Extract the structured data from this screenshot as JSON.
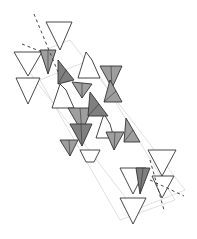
{
  "diagram": {
    "type": "crystal-structure-polyhedra",
    "colors": {
      "background": "#ffffff",
      "stroke": "#333333",
      "shaded": "#9e9e9e",
      "shaded_dark": "#7f7f7f",
      "open": "#ffffff",
      "ghost": "#d8d8d8",
      "axis": "#444444"
    },
    "ghost_bands": [
      [
        [
          20,
          60
        ],
        [
          70,
          40
        ],
        [
          185,
          190
        ],
        [
          135,
          210
        ]
      ],
      [
        [
          40,
          80
        ],
        [
          90,
          60
        ],
        [
          175,
          200
        ],
        [
          120,
          220
        ]
      ]
    ],
    "open_triangles": [
      [
        [
          46,
          22
        ],
        [
          72,
          22
        ],
        [
          60,
          50
        ]
      ],
      [
        [
          14,
          52
        ],
        [
          42,
          52
        ],
        [
          28,
          76
        ]
      ],
      [
        [
          16,
          78
        ],
        [
          40,
          78
        ],
        [
          28,
          104
        ]
      ],
      [
        [
          86,
          52
        ],
        [
          92,
          60
        ],
        [
          100,
          78
        ],
        [
          78,
          78
        ]
      ],
      [
        [
          60,
          84
        ],
        [
          66,
          90
        ],
        [
          74,
          108
        ],
        [
          52,
          108
        ]
      ],
      [
        [
          104,
          114
        ],
        [
          110,
          124
        ],
        [
          114,
          138
        ],
        [
          96,
          138
        ]
      ],
      [
        [
          120,
          168
        ],
        [
          146,
          168
        ],
        [
          133,
          194
        ]
      ],
      [
        [
          120,
          198
        ],
        [
          146,
          198
        ],
        [
          133,
          224
        ]
      ],
      [
        [
          148,
          150
        ],
        [
          176,
          150
        ],
        [
          162,
          176
        ]
      ],
      [
        [
          152,
          176
        ],
        [
          174,
          176
        ],
        [
          162,
          198
        ]
      ],
      [
        [
          80,
          150
        ],
        [
          100,
          150
        ],
        [
          94,
          162
        ],
        [
          86,
          162
        ]
      ]
    ],
    "shaded_triangles": [
      [
        [
          40,
          50
        ],
        [
          56,
          50
        ],
        [
          48,
          74
        ]
      ],
      [
        [
          58,
          60
        ],
        [
          74,
          80
        ],
        [
          58,
          84
        ]
      ],
      [
        [
          72,
          82
        ],
        [
          92,
          84
        ],
        [
          82,
          98
        ]
      ],
      [
        [
          68,
          108
        ],
        [
          92,
          108
        ],
        [
          82,
          132
        ]
      ],
      [
        [
          90,
          92
        ],
        [
          108,
          116
        ],
        [
          88,
          116
        ]
      ],
      [
        [
          100,
          66
        ],
        [
          122,
          66
        ],
        [
          112,
          88
        ]
      ],
      [
        [
          110,
          80
        ],
        [
          122,
          102
        ],
        [
          104,
          102
        ]
      ],
      [
        [
          70,
          124
        ],
        [
          92,
          124
        ],
        [
          82,
          146
        ]
      ],
      [
        [
          126,
          118
        ],
        [
          140,
          142
        ],
        [
          124,
          142
        ]
      ],
      [
        [
          106,
          132
        ],
        [
          124,
          132
        ],
        [
          114,
          150
        ]
      ],
      [
        [
          136,
          168
        ],
        [
          150,
          168
        ],
        [
          140,
          194
        ]
      ],
      [
        [
          60,
          140
        ],
        [
          78,
          140
        ],
        [
          70,
          156
        ]
      ]
    ],
    "axes": [
      {
        "from": [
          34,
          14
        ],
        "to": [
          58,
          72
        ],
        "dash": "3,3"
      },
      {
        "from": [
          22,
          44
        ],
        "to": [
          42,
          52
        ],
        "dash": "3,3"
      },
      {
        "from": [
          150,
          160
        ],
        "to": [
          164,
          210
        ],
        "dash": "3,3"
      },
      {
        "from": [
          150,
          180
        ],
        "to": [
          184,
          196
        ],
        "dash": "3,3"
      }
    ]
  }
}
